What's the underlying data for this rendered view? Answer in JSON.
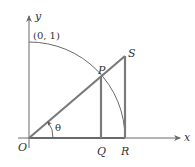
{
  "diagram": {
    "type": "unit-circle-trig-geometry",
    "axes": {
      "x_label": "x",
      "y_label": "y"
    },
    "points": {
      "origin": "O",
      "P": "P",
      "Q": "Q",
      "R": "R",
      "S": "S",
      "y_intercept": "(0, 1)"
    },
    "angle_label": "θ",
    "colors": {
      "stroke": "#7a7a7a",
      "text": "#333333"
    }
  }
}
